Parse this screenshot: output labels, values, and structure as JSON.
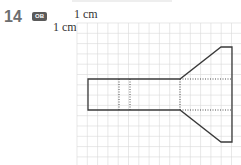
{
  "question": {
    "number": "14",
    "badge": "OB"
  },
  "scale": {
    "horizontal_label": "1 cm",
    "vertical_label": "1 cm"
  },
  "grid": {
    "origin_x": 77,
    "origin_y": 23,
    "cell_px": 10.3,
    "cols": 16,
    "rows": 14,
    "line_color": "#d9d9d9"
  },
  "shape": {
    "stroke_color": "#3a3a3a",
    "outline": [
      [
        88,
        79
      ],
      [
        180,
        79
      ],
      [
        221,
        47
      ],
      [
        232,
        47
      ],
      [
        232,
        142
      ],
      [
        221,
        142
      ],
      [
        180,
        110
      ],
      [
        88,
        110
      ]
    ],
    "dotted_lines": [
      [
        [
          119,
          79
        ],
        [
          119,
          110
        ]
      ],
      [
        [
          130,
          79
        ],
        [
          130,
          110
        ]
      ],
      [
        [
          180,
          79
        ],
        [
          180,
          110
        ]
      ],
      [
        [
          180,
          79
        ],
        [
          232,
          79
        ]
      ],
      [
        [
          180,
          110
        ],
        [
          232,
          110
        ]
      ]
    ]
  }
}
